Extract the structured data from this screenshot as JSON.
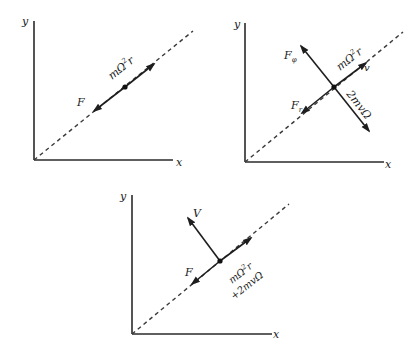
{
  "figure": {
    "colors": {
      "ink": "#1e1e1e",
      "background": "#ffffff"
    },
    "panels": [
      {
        "id": "panel-1",
        "axis_labels": {
          "x": "x",
          "y": "y"
        },
        "labels": {
          "centrifugal": {
            "base": "mΩ",
            "sup": "2",
            "tail": "r"
          },
          "force": "F"
        }
      },
      {
        "id": "panel-2",
        "axis_labels": {
          "x": "x",
          "y": "y"
        },
        "labels": {
          "f_phi": {
            "base": "F",
            "sub": "φ"
          },
          "centrifugal": {
            "base": "mΩ",
            "sup": "2",
            "tail": "r"
          },
          "velocity": "v",
          "f_r": {
            "base": "F",
            "sub": "r"
          },
          "coriolis": "2mvΩ"
        }
      },
      {
        "id": "panel-3",
        "axis_labels": {
          "x": "x",
          "y": "y"
        },
        "labels": {
          "velocity": "V",
          "force": "F",
          "centrifugal": {
            "base": "mΩ",
            "sup": "2",
            "tail": "r"
          },
          "coriolis": "+2mvΩ"
        }
      }
    ]
  }
}
